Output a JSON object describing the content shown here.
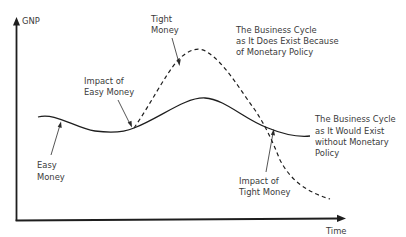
{
  "diagram": {
    "type": "business-cycle-monetary-policy",
    "colors": {
      "line": "#1e1e1e",
      "text": "#3a3a3a",
      "background": "#ffffff"
    },
    "axes": {
      "y_label": "GNP",
      "x_label": "Time"
    },
    "curves": [
      {
        "name": "without-monetary-policy",
        "style": "solid",
        "label_lines": [
          "The Business Cycle",
          "as It Would Exist",
          "without Monetary",
          "Policy"
        ]
      },
      {
        "name": "with-monetary-policy",
        "style": "dashed",
        "label_lines": [
          "The Business Cycle",
          "as It Does Exist Because",
          "of Monetary Policy"
        ]
      }
    ],
    "annotations": {
      "tight_money": [
        "Tight",
        "Money"
      ],
      "impact_easy": [
        "Impact of",
        "Easy Money"
      ],
      "easy_money": [
        "Easy",
        "Money"
      ],
      "impact_tight": [
        "Impact of",
        "Tight Money"
      ]
    }
  }
}
